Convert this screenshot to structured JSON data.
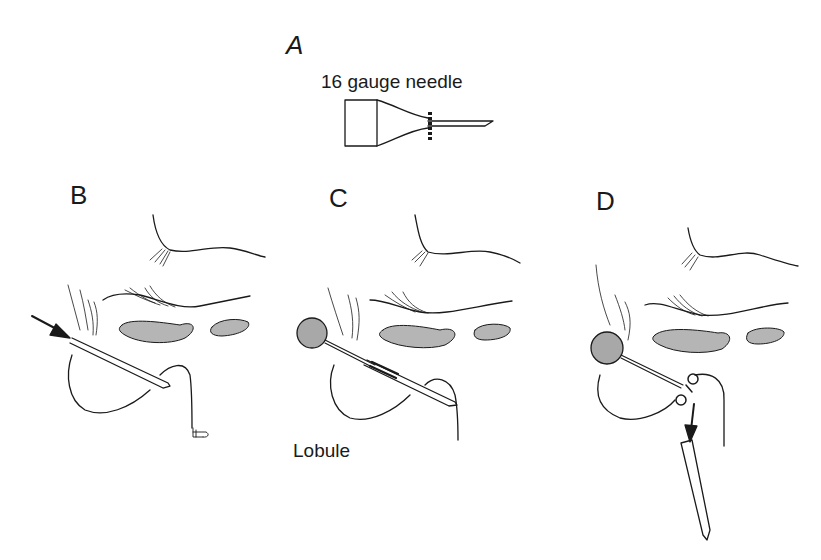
{
  "figure": {
    "panels": [
      {
        "id": "A",
        "letter": "A",
        "caption": "16 gauge needle"
      },
      {
        "id": "B",
        "letter": "B"
      },
      {
        "id": "C",
        "letter": "C",
        "caption": "Lobule"
      },
      {
        "id": "D",
        "letter": "D"
      }
    ],
    "colors": {
      "line": "#1a1a1a",
      "shaded_fill": "#b5b5b5",
      "background": "#ffffff"
    }
  }
}
